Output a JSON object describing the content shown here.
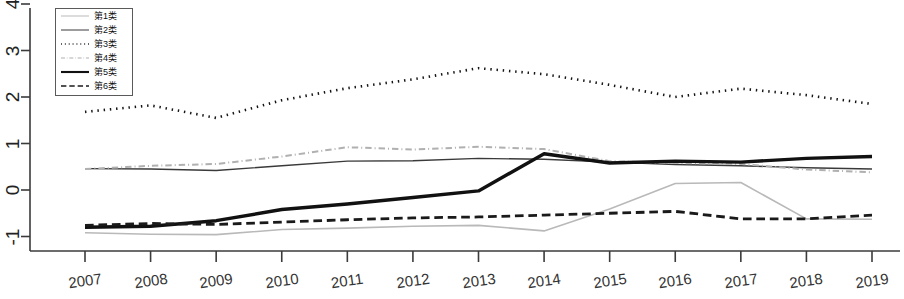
{
  "chart_data": {
    "type": "line",
    "title": "",
    "xlabel": "",
    "ylabel": "",
    "categories": [
      "2007",
      "2008",
      "2009",
      "2010",
      "2011",
      "2012",
      "2013",
      "2014",
      "2015",
      "2016",
      "2017",
      "2018",
      "2019"
    ],
    "x": [
      2007,
      2008,
      2009,
      2010,
      2011,
      2012,
      2013,
      2014,
      2015,
      2016,
      2017,
      2018,
      2019
    ],
    "ylim": [
      -1.35,
      4.3
    ],
    "xlim": [
      2006.55,
      2019.6
    ],
    "yticks": [
      -1,
      0,
      1,
      2,
      3,
      4
    ],
    "ytick_labels": [
      "-1",
      "0",
      "1",
      "2",
      "3",
      "4"
    ],
    "xticks": [
      2007,
      2008,
      2009,
      2010,
      2011,
      2012,
      2013,
      2014,
      2015,
      2016,
      2017,
      2018,
      2019
    ],
    "xtick_labels": [
      "2007",
      "2008",
      "2009",
      "2010",
      "2011",
      "2012",
      "2013",
      "2014",
      "2015",
      "2016",
      "2017",
      "2018",
      "2019"
    ],
    "grid": false,
    "legend_position": "top-left",
    "legend_entries": [
      "第1类",
      "第2类",
      "第3类",
      "第4类",
      "第5类",
      "第6类"
    ],
    "series": [
      {
        "name": "第1类",
        "style": "solid",
        "color": "#b9b9b9",
        "width": 1.6,
        "values": [
          -0.92,
          -0.95,
          -0.96,
          -0.85,
          -0.82,
          -0.78,
          -0.76,
          -0.88,
          -0.41,
          0.14,
          0.16,
          -0.62,
          -0.63
        ]
      },
      {
        "name": "第2类",
        "style": "solid",
        "color": "#3a3a3a",
        "width": 1.4,
        "values": [
          0.46,
          0.45,
          0.42,
          0.52,
          0.62,
          0.63,
          0.68,
          0.66,
          0.6,
          0.55,
          0.52,
          0.48,
          0.45
        ]
      },
      {
        "name": "第3类",
        "style": "dotted",
        "color": "#141414",
        "width": 2.6,
        "values": [
          1.68,
          1.82,
          1.55,
          1.93,
          2.19,
          2.38,
          2.62,
          2.49,
          2.26,
          2.0,
          2.18,
          2.04,
          1.85
        ]
      },
      {
        "name": "第4类",
        "style": "dashdot",
        "color": "#b0b0b0",
        "width": 2.0,
        "values": [
          0.45,
          0.52,
          0.56,
          0.72,
          0.92,
          0.87,
          0.93,
          0.88,
          0.62,
          0.58,
          0.56,
          0.44,
          0.38
        ]
      },
      {
        "name": "第5类",
        "style": "solid",
        "color": "#111111",
        "width": 3.4,
        "values": [
          -0.8,
          -0.78,
          -0.66,
          -0.42,
          -0.3,
          -0.16,
          -0.02,
          0.78,
          0.58,
          0.62,
          0.6,
          0.68,
          0.72
        ]
      },
      {
        "name": "第6类",
        "style": "dashed",
        "color": "#1a1a1a",
        "width": 2.8,
        "values": [
          -0.76,
          -0.72,
          -0.74,
          -0.69,
          -0.64,
          -0.6,
          -0.58,
          -0.54,
          -0.5,
          -0.46,
          -0.62,
          -0.62,
          -0.54
        ]
      }
    ]
  },
  "axes": {
    "y_axis_label": "",
    "x_axis_label": ""
  }
}
